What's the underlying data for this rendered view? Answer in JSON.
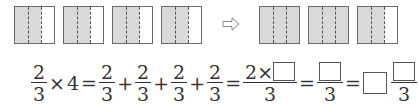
{
  "diagram": {
    "left_squares": [
      {
        "shaded_parts": 2,
        "total_parts": 3
      },
      {
        "shaded_parts": 2,
        "total_parts": 3
      },
      {
        "shaded_parts": 2,
        "total_parts": 3
      },
      {
        "shaded_parts": 2,
        "total_parts": 3
      }
    ],
    "arrow": "⇨",
    "right_squares": [
      {
        "shaded_parts": 3,
        "total_parts": 3
      },
      {
        "shaded_parts": 3,
        "total_parts": 3
      },
      {
        "shaded_parts": 2,
        "total_parts": 3
      }
    ],
    "colors": {
      "shade": "#d9d9d9",
      "border": "#6a6a6a",
      "dash": "#555555"
    }
  },
  "equation": {
    "f1": {
      "num": "2",
      "den": "3"
    },
    "times": "×",
    "multiplier": "4",
    "eq": "=",
    "plus": "+",
    "addend": {
      "num": "2",
      "den": "3"
    },
    "step2": {
      "num_prefix": "2×",
      "den": "3"
    },
    "step3": {
      "den": "3"
    },
    "step4": {
      "den": "3"
    }
  }
}
